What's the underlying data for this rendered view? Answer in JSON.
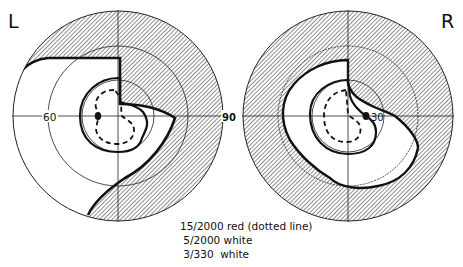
{
  "figure": {
    "type": "visual field perimetry (both eyes)",
    "left_eye": {
      "label": "L",
      "axis_labels": {
        "horizontal_left": "60"
      }
    },
    "right_eye": {
      "label": "R",
      "axis_labels": {
        "horizontal_right": "30"
      }
    },
    "shared_axis_label": "90",
    "colors": {
      "ink": "#111111",
      "background": "#ffffff",
      "hatch": "#333333"
    }
  },
  "legend": {
    "items": [
      {
        "isopter": "15/2000",
        "description": "red (dotted line)"
      },
      {
        "isopter": "5/2000",
        "description": "white"
      },
      {
        "isopter": "3/330",
        "description": "white"
      }
    ],
    "lines": [
      "15/2000 red (dotted line)",
      " 5/2000 white",
      " 3/330  white"
    ]
  }
}
